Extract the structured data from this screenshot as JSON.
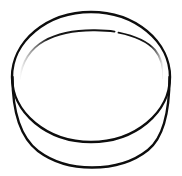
{
  "image": {
    "title": "Line drawing of a shallow round container",
    "subject": "bowl-lid-dish",
    "style": "black-outline-line-art",
    "width": 182,
    "height": 176,
    "background_color": "#ffffff",
    "stroke_color": "#0d0d0d",
    "alt_text": "Simple black outline drawing of a shallow cylindrical container or lid seen from a slightly raised angle, showing an elliptical top opening, a short curved side wall, and a faint inner rim arc."
  },
  "geometry": {
    "top_ellipse": {
      "name": "top-opening-ellipse",
      "cx": 91,
      "cy": 77,
      "rx": 79,
      "ry": 65,
      "stroke_width": 2.4
    },
    "body_wall": {
      "name": "side-wall-bottom-arc",
      "path": "M 12.5 77 C 12.5 112 20 137 38 151 C 54 163 74 167.5 92 167.5 C 112 167.5 133 162 148 150 C 163 138 169.5 114 169.5 77",
      "stroke_width": 2.4
    },
    "inner_rim_left": {
      "name": "inner-rim-arc-left-segment",
      "path": "M 19.5 79 C 22 62 30 49 44 41 C 58 33 78 30 95 30.2 C 104 30.3 110 30.8 114.5 31.6",
      "stroke_width": 1.9
    },
    "inner_rim_right": {
      "name": "inner-rim-arc-right-segment",
      "path": "M 118.5 32.6 C 133 35.5 147 41 155 50 C 161 57 163.5 67 163.5 78.5",
      "stroke_width": 1.9
    },
    "rim_gap": {
      "name": "inner-rim-gap",
      "x_start": 114.5,
      "x_end": 118.5
    }
  },
  "fade_stops": {
    "left_tail_opacity": 0.0,
    "left_body_opacity": 1.0,
    "right_tail_opacity": 0.0,
    "right_body_opacity": 1.0
  }
}
